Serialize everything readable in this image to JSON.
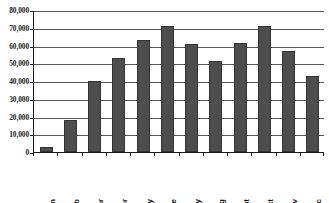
{
  "chart_data": {
    "type": "bar",
    "title": "",
    "subtitle": "",
    "xlabel": "",
    "ylabel": "",
    "categories": [
      "Jan",
      "Feb",
      "Mar",
      "Apr",
      "May",
      "June",
      "July",
      "Aug",
      "Sept",
      "Oct",
      "Nov",
      "Dec"
    ],
    "values": [
      3000,
      18000,
      40000,
      53000,
      63000,
      71000,
      61000,
      51000,
      61500,
      71000,
      57000,
      43000
    ],
    "series": [
      {
        "name": "",
        "values": [
          3000,
          18000,
          40000,
          53000,
          63000,
          71000,
          61000,
          51000,
          61500,
          71000,
          57000,
          43000
        ]
      }
    ],
    "ylim": [
      0,
      80000
    ],
    "ytick_values": [
      0,
      10000,
      20000,
      30000,
      40000,
      50000,
      60000,
      70000,
      80000
    ],
    "ytick_labels": [
      "0",
      "10,000",
      "20,000",
      "30,000",
      "40,000",
      "50,000",
      "60,000",
      "70,000",
      "80,000"
    ],
    "grid": true,
    "grid_axis": "y",
    "legend": false,
    "legend_position": "none",
    "annotations": [],
    "colors": {
      "bar_fill": "#4d4d4d",
      "bar_border": "#333333",
      "gridline": "#5a5a5a",
      "axis": "#1a1a1a",
      "background": "#ffffff",
      "tick_text": "#1a1a1a"
    }
  },
  "axes": {
    "y": {
      "tick_labels": [
        "80,000",
        "70,000",
        "60,000",
        "50,000",
        "40,000",
        "30,000",
        "20,000",
        "10,000",
        "0"
      ]
    },
    "x": {
      "tick_labels": [
        "Jan",
        "Feb",
        "Mar",
        "Apr",
        "May",
        "June",
        "July",
        "Aug",
        "Sept",
        "Oct",
        "Nov",
        "Dec"
      ]
    }
  }
}
